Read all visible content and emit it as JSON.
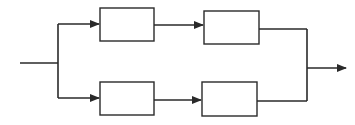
{
  "diagram": {
    "type": "block-diagram",
    "colors": {
      "stroke": "#2a2a2a",
      "fill": "#ffffff",
      "background": "#ffffff"
    },
    "blocks": [
      {
        "id": "top-left",
        "label": "",
        "x": 100,
        "y": 8,
        "w": 54,
        "h": 33
      },
      {
        "id": "top-right",
        "label": "",
        "x": 204,
        "y": 11,
        "w": 55,
        "h": 33
      },
      {
        "id": "bottom-left",
        "label": "",
        "x": 100,
        "y": 82,
        "w": 54,
        "h": 33
      },
      {
        "id": "bottom-right",
        "label": "",
        "x": 202,
        "y": 82,
        "w": 55,
        "h": 34
      }
    ],
    "input": {
      "label": ""
    },
    "output": {
      "label": ""
    }
  }
}
